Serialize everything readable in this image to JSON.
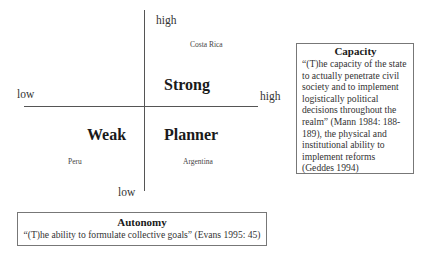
{
  "axes": {
    "vertical": {
      "top_label": "high",
      "bottom_label": "low"
    },
    "horizontal": {
      "left_label": "low",
      "right_label": "high"
    }
  },
  "quadrants": {
    "top_right": {
      "label": "Strong",
      "country": "Costa Rica"
    },
    "bottom_left": {
      "label": "Weak",
      "country": "Peru"
    },
    "bottom_right": {
      "label": "Planner",
      "country": "Argentina"
    }
  },
  "capacity_box": {
    "title": "Capacity",
    "text": "“(T)he capacity of the state to actually penetrate civil society and to implement logistically political decisions throughout the realm” (Mann 1984: 188-189), the physical and institutional ability to implement reforms (Geddes 1994)"
  },
  "autonomy_box": {
    "title": "Autonomy",
    "text": "“(T)he ability to formulate collective goals” (Evans 1995: 45)"
  },
  "colors": {
    "axis": "#555555",
    "box_border": "#777777",
    "text": "#222222"
  }
}
